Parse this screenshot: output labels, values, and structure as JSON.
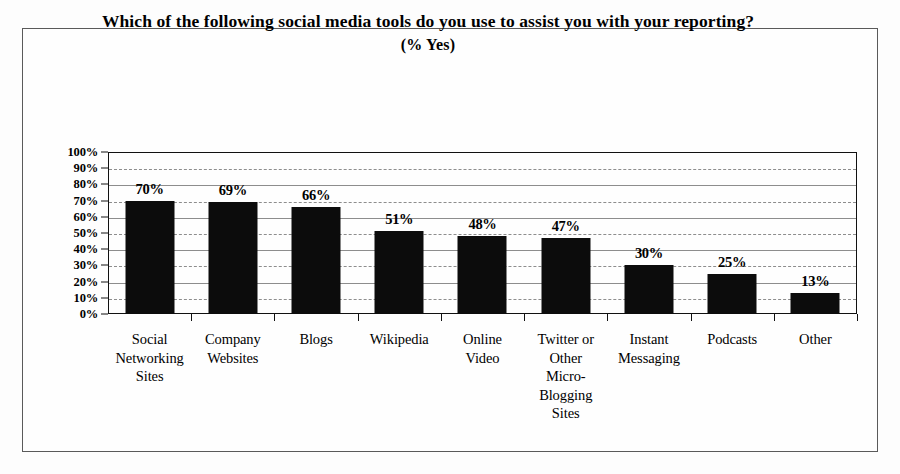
{
  "chart_data": {
    "type": "bar",
    "title": "Which of the following social media tools do you use to assist you with your reporting?",
    "subtitle": "(% Yes)",
    "xlabel": "",
    "ylabel": "",
    "ylim": [
      0,
      100
    ],
    "grid": true,
    "legend": "none",
    "orientation": "vertical",
    "bar_color": "#0c0c0c",
    "categories": [
      "Social Networking Sites",
      "Company Websites",
      "Blogs",
      "Wikipedia",
      "Online Video",
      "Twitter or Other Micro-Blogging Sites",
      "Instant Messaging",
      "Podcasts",
      "Other"
    ],
    "category_lines": [
      [
        "Social",
        "Networking",
        "Sites"
      ],
      [
        "Company",
        "Websites"
      ],
      [
        "Blogs"
      ],
      [
        "Wikipedia"
      ],
      [
        "Online",
        "Video"
      ],
      [
        "Twitter or",
        "Other",
        "Micro-",
        "Blogging",
        "Sites"
      ],
      [
        "Instant",
        "Messaging"
      ],
      [
        "Podcasts"
      ],
      [
        "Other"
      ]
    ],
    "values": [
      70,
      69,
      66,
      51,
      48,
      47,
      30,
      25,
      13
    ],
    "data_labels": [
      "70%",
      "69%",
      "66%",
      "51%",
      "48%",
      "47%",
      "30%",
      "25%",
      "13%"
    ],
    "y_ticks": [
      0,
      10,
      20,
      30,
      40,
      50,
      60,
      70,
      80,
      90,
      100
    ],
    "y_tick_labels": [
      "0%",
      "10%",
      "20%",
      "30%",
      "40%",
      "50%",
      "60%",
      "70%",
      "80%",
      "90%",
      "100%"
    ]
  }
}
